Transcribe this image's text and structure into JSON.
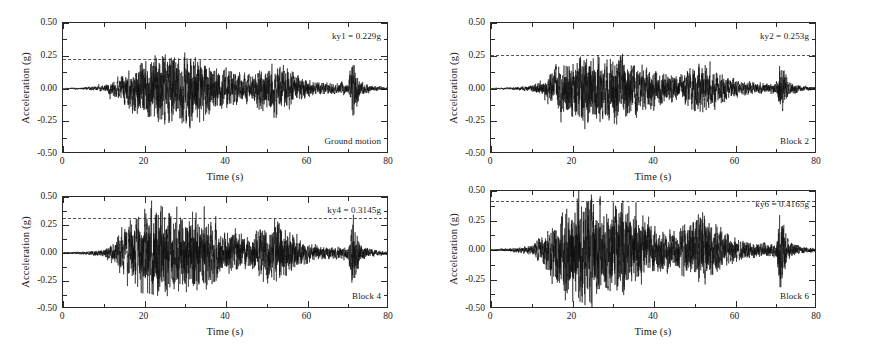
{
  "figure": {
    "background": "#ffffff",
    "axis_color": "#2a2a2a",
    "trace_color": "#111111",
    "threshold_color": "#555555",
    "panel_count": 4
  },
  "axes_common": {
    "ylabel": "Acceleration (g)",
    "xlabel": "Time (s)",
    "ytick_labels": [
      "0.50",
      "0.25",
      "0.00",
      "-0.25",
      "-0.50"
    ],
    "ytick_values": [
      0.5,
      0.25,
      0,
      -0.25,
      -0.5
    ],
    "xtick_labels": [
      "0",
      "20",
      "40",
      "60",
      "80"
    ],
    "xtick_values": [
      0,
      20,
      40,
      60,
      80
    ],
    "ylim": [
      -0.5,
      0.5
    ],
    "xlim": [
      0,
      80
    ],
    "grid": false
  },
  "panels": [
    {
      "id": "panel-ground-motion",
      "ky_label": "ky1 = 0.229g",
      "ky_value": 0.229,
      "block_label": "Ground motion",
      "peak_positive": 0.3,
      "peak_negative": -0.26
    },
    {
      "id": "panel-block-2",
      "ky_label": "ky2 = 0.253g",
      "ky_value": 0.253,
      "block_label": "Block 2",
      "peak_positive": 0.29,
      "peak_negative": -0.25
    },
    {
      "id": "panel-block-4",
      "ky_label": "ky4 = 0.3145g",
      "ky_value": 0.3145,
      "block_label": "Block 4",
      "peak_positive": 0.42,
      "peak_negative": -0.44
    },
    {
      "id": "panel-block-6",
      "ky_label": "ky6 = 0.4165g",
      "ky_value": 0.4165,
      "block_label": "Block 6",
      "peak_positive": 0.5,
      "peak_negative": -0.45
    }
  ],
  "chart_data": [
    {
      "type": "line",
      "title": "Ground motion",
      "xlabel": "Time (s)",
      "ylabel": "Acceleration (g)",
      "xlim": [
        0,
        80
      ],
      "ylim": [
        -0.5,
        0.5
      ],
      "xticks": [
        0,
        20,
        40,
        60,
        80
      ],
      "yticks": [
        -0.5,
        -0.25,
        0,
        0.25,
        0.5
      ],
      "grid": false,
      "legend": "none",
      "annotations": [
        "ky1 = 0.229g",
        "Ground motion"
      ],
      "series": [
        {
          "name": "acceleration time history",
          "description": "Earthquake acceleration record; quiescent until ~10 s, strong shaking 15-40 s, decaying tail with an isolated burst near 71 s.",
          "envelope_time": [
            0,
            5,
            10,
            13,
            16,
            19,
            22,
            25,
            28,
            31,
            34,
            37,
            40,
            43,
            46,
            49,
            52,
            55,
            58,
            61,
            64,
            67,
            70,
            71,
            73,
            76,
            80
          ],
          "envelope_amplitude": [
            0.004,
            0.008,
            0.02,
            0.06,
            0.13,
            0.19,
            0.24,
            0.26,
            0.21,
            0.25,
            0.22,
            0.16,
            0.13,
            0.11,
            0.09,
            0.14,
            0.19,
            0.13,
            0.08,
            0.05,
            0.04,
            0.035,
            0.04,
            0.21,
            0.05,
            0.02,
            0.008
          ]
        }
      ],
      "threshold_line": {
        "label": "ky1",
        "value": 0.229,
        "style": "dashed"
      }
    },
    {
      "type": "line",
      "title": "Block 2",
      "xlabel": "Time (s)",
      "ylabel": "Acceleration (g)",
      "xlim": [
        0,
        80
      ],
      "ylim": [
        -0.5,
        0.5
      ],
      "xticks": [
        0,
        20,
        40,
        60,
        80
      ],
      "yticks": [
        -0.5,
        -0.25,
        0,
        0.25,
        0.5
      ],
      "grid": false,
      "legend": "none",
      "annotations": [
        "ky2 = 0.253g",
        "Block 2"
      ],
      "series": [
        {
          "name": "acceleration time history",
          "description": "Block 2 response; similar envelope to ground motion with slightly clipped peaks above ky2.",
          "envelope_time": [
            0,
            5,
            10,
            13,
            16,
            19,
            22,
            25,
            28,
            31,
            34,
            37,
            40,
            43,
            46,
            49,
            52,
            55,
            58,
            61,
            64,
            67,
            70,
            71,
            73,
            76,
            80
          ],
          "envelope_amplitude": [
            0.004,
            0.008,
            0.02,
            0.06,
            0.14,
            0.2,
            0.25,
            0.25,
            0.2,
            0.24,
            0.21,
            0.15,
            0.12,
            0.1,
            0.09,
            0.13,
            0.18,
            0.12,
            0.08,
            0.05,
            0.04,
            0.035,
            0.04,
            0.19,
            0.05,
            0.02,
            0.008
          ]
        }
      ],
      "threshold_line": {
        "label": "ky2",
        "value": 0.253,
        "style": "dashed"
      }
    },
    {
      "type": "line",
      "title": "Block 4",
      "xlabel": "Time (s)",
      "ylabel": "Acceleration (g)",
      "xlim": [
        0,
        80
      ],
      "ylim": [
        -0.5,
        0.5
      ],
      "xticks": [
        0,
        20,
        40,
        60,
        80
      ],
      "yticks": [
        -0.5,
        -0.25,
        0,
        0.25,
        0.5
      ],
      "grid": false,
      "legend": "none",
      "annotations": [
        "ky4 = 0.3145g",
        "Block 4"
      ],
      "series": [
        {
          "name": "acceleration time history",
          "description": "Block 4 response; amplified amplitudes reaching about +-0.44 g during the strong-motion window.",
          "envelope_time": [
            0,
            5,
            10,
            13,
            16,
            19,
            22,
            25,
            28,
            31,
            34,
            37,
            40,
            43,
            46,
            49,
            52,
            55,
            58,
            61,
            64,
            67,
            70,
            71,
            73,
            76,
            80
          ],
          "envelope_amplitude": [
            0.006,
            0.012,
            0.03,
            0.1,
            0.22,
            0.3,
            0.38,
            0.36,
            0.28,
            0.33,
            0.3,
            0.22,
            0.18,
            0.15,
            0.13,
            0.2,
            0.26,
            0.18,
            0.11,
            0.07,
            0.05,
            0.045,
            0.05,
            0.3,
            0.07,
            0.03,
            0.01
          ]
        }
      ],
      "threshold_line": {
        "label": "ky4",
        "value": 0.3145,
        "style": "dashed"
      }
    },
    {
      "type": "line",
      "title": "Block 6",
      "xlabel": "Time (s)",
      "ylabel": "Acceleration (g)",
      "xlim": [
        0,
        80
      ],
      "ylim": [
        -0.5,
        0.5
      ],
      "xticks": [
        0,
        20,
        40,
        60,
        80
      ],
      "yticks": [
        -0.5,
        -0.25,
        0,
        0.25,
        0.5
      ],
      "grid": false,
      "legend": "none",
      "annotations": [
        "ky6 = 0.4165g",
        "Block 6"
      ],
      "series": [
        {
          "name": "acceleration time history",
          "description": "Block 6 response; largest amplification with peaks approaching the +-0.50 g axis limits near 25 s.",
          "envelope_time": [
            0,
            5,
            10,
            13,
            16,
            19,
            22,
            25,
            28,
            31,
            34,
            37,
            40,
            43,
            46,
            49,
            52,
            55,
            58,
            61,
            64,
            67,
            70,
            71,
            73,
            76,
            80
          ],
          "envelope_amplitude": [
            0.006,
            0.014,
            0.035,
            0.12,
            0.25,
            0.34,
            0.44,
            0.42,
            0.31,
            0.36,
            0.32,
            0.24,
            0.19,
            0.16,
            0.14,
            0.22,
            0.28,
            0.19,
            0.12,
            0.08,
            0.055,
            0.05,
            0.055,
            0.33,
            0.08,
            0.03,
            0.01
          ]
        }
      ],
      "threshold_line": {
        "label": "ky6",
        "value": 0.4165,
        "style": "dashed"
      }
    }
  ]
}
